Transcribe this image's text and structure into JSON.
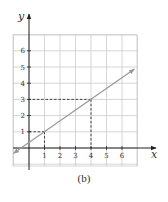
{
  "chart_data": {
    "type": "line",
    "title": "",
    "xlabel": "x",
    "ylabel": "y",
    "caption": "(b)",
    "xlim": [
      -1,
      7
    ],
    "ylim": [
      -1,
      7
    ],
    "grid": true,
    "x_ticks": [
      "1",
      "2",
      "3",
      "4",
      "5",
      "6"
    ],
    "y_ticks": [
      "1",
      "2",
      "3",
      "4",
      "5",
      "6"
    ],
    "series": [
      {
        "name": "line",
        "equation": "y = (2/3)x + 1/3",
        "x": [
          -1,
          1,
          4,
          6.8
        ],
        "y": [
          -0.33,
          1,
          3,
          4.87
        ],
        "arrows": "both ends"
      }
    ],
    "annotations": [
      {
        "type": "dashed-guide",
        "point": [
          1,
          1
        ],
        "to": [
          "x-axis",
          "y-axis"
        ]
      },
      {
        "type": "dashed-guide",
        "point": [
          4,
          3
        ],
        "to": [
          "x-axis",
          "y-axis"
        ]
      }
    ],
    "colors": {
      "grid": "#cccccc",
      "axes": "#222222",
      "line": "#999999",
      "dashed": "#333333"
    }
  }
}
